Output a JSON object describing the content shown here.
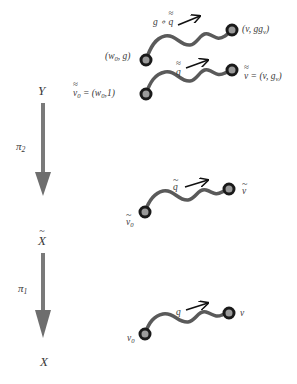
{
  "diagram": {
    "type": "covering-space path lifting",
    "colors": {
      "path": "#5a5a5a",
      "arrow": "#7a7a7a",
      "node_fill": "#9a9a9a",
      "node_ring": "#1a1a1a",
      "text": "#3a3a3a"
    },
    "spaces": {
      "Y": {
        "base": "Y"
      },
      "Xtilde": {
        "base": "X",
        "decoration": "tilde"
      },
      "X": {
        "base": "X"
      }
    },
    "projections": {
      "pi2": {
        "base": "π",
        "sub": "2"
      },
      "pi1": {
        "base": "π",
        "sub": "1"
      }
    },
    "levels": {
      "Y_upper": {
        "path_label": {
          "prefix": "g ∘ ",
          "base": "q",
          "decoration": "double-tilde"
        },
        "start_label": {
          "text_a": "(w",
          "sub": "0",
          "text_b": ", g)"
        },
        "end_label": {
          "text_a": "(v, gg",
          "sub": "v",
          "text_b": ")"
        }
      },
      "Y_lower": {
        "path_label": {
          "base": "q",
          "decoration": "double-tilde"
        },
        "start_label": {
          "base": "v",
          "sub": "0",
          "decoration": "double-tilde",
          "rhs_a": " = (w",
          "rhs_sub": "0",
          "rhs_b": ",1)"
        },
        "end_label": {
          "base": "v",
          "decoration": "double-tilde",
          "rhs_a": " = (v, g",
          "rhs_sub": "v",
          "rhs_b": ")"
        }
      },
      "Xtilde": {
        "path_label": {
          "base": "q",
          "decoration": "tilde"
        },
        "start_label": {
          "base": "v",
          "sub": "0",
          "decoration": "tilde"
        },
        "end_label": {
          "base": "v",
          "decoration": "tilde"
        }
      },
      "X": {
        "path_label": {
          "base": "q"
        },
        "start_label": {
          "base": "v",
          "sub": "0"
        },
        "end_label": {
          "base": "v"
        }
      }
    }
  }
}
